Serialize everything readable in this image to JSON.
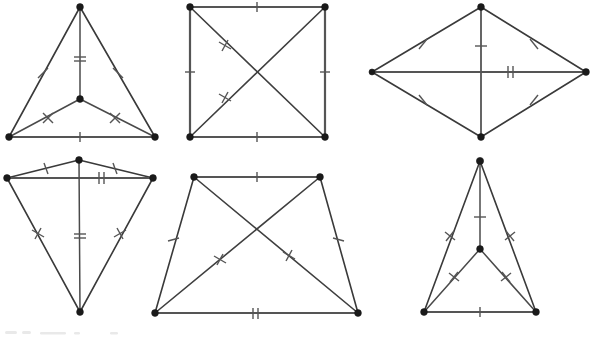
{
  "page": {
    "width": 590,
    "height": 339,
    "background_color": "#ffffff",
    "line_color": "#3a3a3a",
    "vertex_color": "#1a1a1a",
    "tick_color": "#555555",
    "figure_count": 6
  },
  "figures": [
    {
      "id": "figure-1",
      "name": "triangle-with-interior-point",
      "shape": "triangle",
      "position": "top-left",
      "vertices": [
        {
          "name": "apex",
          "x": 80,
          "y": 7
        },
        {
          "name": "bottom-left",
          "x": 9,
          "y": 137
        },
        {
          "name": "bottom-right",
          "x": 155,
          "y": 137
        },
        {
          "name": "interior-center",
          "x": 80,
          "y": 99
        }
      ],
      "edges": [
        {
          "from": "apex",
          "to": "bottom-left",
          "ticks": 1
        },
        {
          "from": "apex",
          "to": "bottom-right",
          "ticks": 1
        },
        {
          "from": "bottom-left",
          "to": "bottom-right",
          "ticks": 1
        },
        {
          "from": "apex",
          "to": "interior-center",
          "ticks": 2
        },
        {
          "from": "interior-center",
          "to": "bottom-left",
          "ticks": 1
        },
        {
          "from": "interior-center",
          "to": "bottom-right",
          "ticks": 1
        }
      ]
    },
    {
      "id": "figure-2",
      "name": "square-with-diagonals",
      "shape": "square",
      "position": "top-center",
      "vertices": [
        {
          "name": "top-left",
          "x": 190,
          "y": 7
        },
        {
          "name": "top-right",
          "x": 325,
          "y": 7
        },
        {
          "name": "bottom-right",
          "x": 325,
          "y": 137
        },
        {
          "name": "bottom-left",
          "x": 190,
          "y": 137
        }
      ],
      "edges": [
        {
          "from": "top-left",
          "to": "top-right",
          "ticks": 1
        },
        {
          "from": "top-right",
          "to": "bottom-right",
          "ticks": 1
        },
        {
          "from": "bottom-right",
          "to": "bottom-left",
          "ticks": 1
        },
        {
          "from": "bottom-left",
          "to": "top-left",
          "ticks": 1
        },
        {
          "from": "top-left",
          "to": "bottom-right",
          "ticks": 2
        },
        {
          "from": "top-right",
          "to": "bottom-left",
          "ticks": 2
        }
      ]
    },
    {
      "id": "figure-3",
      "name": "rhombus-with-diagonals",
      "shape": "rhombus",
      "position": "top-right",
      "vertices": [
        {
          "name": "top",
          "x": 481,
          "y": 7
        },
        {
          "name": "right",
          "x": 586,
          "y": 72
        },
        {
          "name": "bottom",
          "x": 481,
          "y": 137
        },
        {
          "name": "left",
          "x": 372,
          "y": 72
        }
      ],
      "edges": [
        {
          "from": "left",
          "to": "top",
          "ticks": 1
        },
        {
          "from": "top",
          "to": "right",
          "ticks": 1
        },
        {
          "from": "right",
          "to": "bottom",
          "ticks": 1
        },
        {
          "from": "bottom",
          "to": "left",
          "ticks": 1
        },
        {
          "from": "top",
          "to": "bottom",
          "ticks": 1
        },
        {
          "from": "left",
          "to": "right",
          "ticks": 2
        }
      ]
    },
    {
      "id": "figure-4",
      "name": "kite-with-axis-and-crossbar",
      "shape": "kite",
      "position": "bottom-left",
      "vertices": [
        {
          "name": "top",
          "x": 79,
          "y": 160
        },
        {
          "name": "left",
          "x": 7,
          "y": 178
        },
        {
          "name": "right",
          "x": 153,
          "y": 178
        },
        {
          "name": "bottom",
          "x": 80,
          "y": 312
        }
      ],
      "edges": [
        {
          "from": "left",
          "to": "top",
          "ticks": 1
        },
        {
          "from": "top",
          "to": "right",
          "ticks": 1
        },
        {
          "from": "left",
          "to": "right",
          "ticks": 2
        },
        {
          "from": "left",
          "to": "bottom",
          "ticks": 2
        },
        {
          "from": "right",
          "to": "bottom",
          "ticks": 2
        },
        {
          "from": "top",
          "to": "bottom",
          "ticks": 2
        }
      ]
    },
    {
      "id": "figure-5",
      "name": "isosceles-trapezoid-with-diagonals",
      "shape": "trapezoid",
      "position": "bottom-center",
      "vertices": [
        {
          "name": "top-left",
          "x": 194,
          "y": 177
        },
        {
          "name": "top-right",
          "x": 320,
          "y": 177
        },
        {
          "name": "bottom-right",
          "x": 358,
          "y": 313
        },
        {
          "name": "bottom-left",
          "x": 155,
          "y": 313
        }
      ],
      "edges": [
        {
          "from": "top-left",
          "to": "top-right",
          "ticks": 1
        },
        {
          "from": "top-right",
          "to": "bottom-right",
          "ticks": 1
        },
        {
          "from": "bottom-right",
          "to": "bottom-left",
          "ticks": 2
        },
        {
          "from": "bottom-left",
          "to": "top-left",
          "ticks": 1
        },
        {
          "from": "top-left",
          "to": "bottom-right",
          "ticks": 2
        },
        {
          "from": "top-right",
          "to": "bottom-left",
          "ticks": 2
        }
      ]
    },
    {
      "id": "figure-6",
      "name": "tall-triangle-with-interior-point",
      "shape": "triangle",
      "position": "bottom-right",
      "vertices": [
        {
          "name": "apex",
          "x": 480,
          "y": 161
        },
        {
          "name": "bottom-left",
          "x": 424,
          "y": 312
        },
        {
          "name": "bottom-right",
          "x": 536,
          "y": 312
        },
        {
          "name": "interior-center",
          "x": 480,
          "y": 249
        }
      ],
      "edges": [
        {
          "from": "apex",
          "to": "bottom-left",
          "ticks": 2
        },
        {
          "from": "apex",
          "to": "bottom-right",
          "ticks": 2
        },
        {
          "from": "bottom-left",
          "to": "bottom-right",
          "ticks": 1
        },
        {
          "from": "apex",
          "to": "interior-center",
          "ticks": 1
        },
        {
          "from": "interior-center",
          "to": "bottom-left",
          "ticks": 1
        },
        {
          "from": "interior-center",
          "to": "bottom-right",
          "ticks": 1
        }
      ]
    }
  ],
  "artifacts": {
    "name": "scan-smudge",
    "location": "bottom-left-margin",
    "x": 5,
    "y": 330
  }
}
